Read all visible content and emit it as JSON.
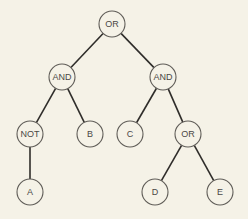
{
  "diagram": {
    "type": "tree",
    "nodes": [
      {
        "id": "n1",
        "label": "OR"
      },
      {
        "id": "n2",
        "label": "AND"
      },
      {
        "id": "n3",
        "label": "AND"
      },
      {
        "id": "n4",
        "label": "NOT"
      },
      {
        "id": "n5",
        "label": "B"
      },
      {
        "id": "n6",
        "label": "C"
      },
      {
        "id": "n7",
        "label": "OR"
      },
      {
        "id": "n8",
        "label": "A"
      },
      {
        "id": "n9",
        "label": "D"
      },
      {
        "id": "n10",
        "label": "E"
      }
    ],
    "edges": [
      {
        "from": "n1",
        "to": "n2"
      },
      {
        "from": "n1",
        "to": "n3"
      },
      {
        "from": "n2",
        "to": "n4"
      },
      {
        "from": "n2",
        "to": "n5"
      },
      {
        "from": "n3",
        "to": "n6"
      },
      {
        "from": "n3",
        "to": "n7"
      },
      {
        "from": "n4",
        "to": "n8"
      },
      {
        "from": "n7",
        "to": "n9"
      },
      {
        "from": "n7",
        "to": "n10"
      }
    ]
  }
}
